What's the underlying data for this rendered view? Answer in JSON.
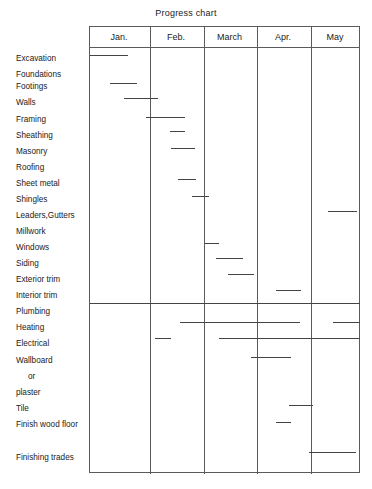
{
  "chart_data": {
    "type": "bar",
    "orientation": "horizontal",
    "subtype": "gantt",
    "title": "Progress chart",
    "xlabel": "",
    "ylabel": "",
    "grid": true,
    "legend": "none",
    "axis_unit": "month",
    "x_categories": [
      "Jan.",
      "Feb.",
      "March",
      "Apr.",
      "May"
    ],
    "x_axis_ranges": [
      {
        "label": "Jan.",
        "left_px": 89,
        "right_px": 149
      },
      {
        "label": "Feb.",
        "left_px": 149,
        "right_px": 203
      },
      {
        "label": "March",
        "left_px": 203,
        "right_px": 256
      },
      {
        "label": "Apr.",
        "left_px": 256,
        "right_px": 310
      },
      {
        "label": "May",
        "left_px": 310,
        "right_px": 360
      }
    ],
    "categories": [
      "Excavation",
      "Foundations",
      "Footings",
      "Walls",
      "Framing",
      "Sheathing",
      "Masonry",
      "Roofing",
      "Sheet metal",
      "Shingles",
      "Leaders,Gutters",
      "Millwork",
      "Windows",
      "Siding",
      "Exterior trim",
      "Interior trim",
      "Plumbing",
      "Heating",
      "Electrical",
      "Wallboard",
      "or",
      "plaster",
      "Tile",
      "Finish wood floor",
      "Finishing trades"
    ],
    "tasks": [
      {
        "name": "Excavation",
        "label_y": 58,
        "bar_y": 55,
        "start_px": 90,
        "end_px": 128,
        "start_month": 0.02,
        "end_month": 0.65
      },
      {
        "name": "Foundations",
        "label_y": 74,
        "bar_y": null,
        "start_px": null,
        "end_px": null,
        "start_month": null,
        "end_month": null
      },
      {
        "name": "Footings",
        "label_y": 86,
        "bar_y": 83,
        "start_px": 110,
        "end_px": 137,
        "start_month": 0.35,
        "end_month": 0.8
      },
      {
        "name": "Walls",
        "label_y": 102,
        "bar_y": 98,
        "start_px": 124,
        "end_px": 158,
        "start_month": 0.58,
        "end_month": 1.15
      },
      {
        "name": "Framing",
        "label_y": 119,
        "bar_y": 117,
        "start_px": 146,
        "end_px": 185,
        "start_month": 0.95,
        "end_month": 1.67
      },
      {
        "name": "Sheathing",
        "label_y": 135,
        "bar_y": 131,
        "start_px": 170,
        "end_px": 185,
        "start_month": 1.39,
        "end_month": 1.67
      },
      {
        "name": "Masonry",
        "label_y": 151,
        "bar_y": 148,
        "start_px": 171,
        "end_px": 195,
        "start_month": 1.41,
        "end_month": 1.85
      },
      {
        "name": "Roofing",
        "label_y": 167,
        "bar_y": null,
        "start_px": null,
        "end_px": null,
        "start_month": null,
        "end_month": null
      },
      {
        "name": "Sheet metal",
        "label_y": 183,
        "bar_y": 179,
        "start_px": 178,
        "end_px": 196,
        "start_month": 1.54,
        "end_month": 1.87
      },
      {
        "name": "Shingles",
        "label_y": 199,
        "bar_y": 196,
        "start_px": 192,
        "end_px": 209,
        "start_month": 1.8,
        "end_month": 2.11
      },
      {
        "name": "Leaders,Gutters",
        "label_y": 215,
        "bar_y": 211,
        "start_px": 328,
        "end_px": 357,
        "start_month": 4.36,
        "end_month": 4.94
      },
      {
        "name": "Millwork",
        "label_y": 231,
        "bar_y": null,
        "start_px": null,
        "end_px": null,
        "start_month": null,
        "end_month": null
      },
      {
        "name": "Windows",
        "label_y": 247,
        "bar_y": 243,
        "start_px": 205,
        "end_px": 219,
        "start_month": 2.04,
        "end_month": 2.3
      },
      {
        "name": "Siding",
        "label_y": 263,
        "bar_y": 258,
        "start_px": 216,
        "end_px": 243,
        "start_month": 2.24,
        "end_month": 2.75
      },
      {
        "name": "Exterior trim",
        "label_y": 279,
        "bar_y": 274,
        "start_px": 228,
        "end_px": 254,
        "start_month": 2.47,
        "end_month": 2.96
      },
      {
        "name": "Interior trim",
        "label_y": 295,
        "bar_y": 290,
        "start_px": 276,
        "end_px": 301,
        "start_month": 3.37,
        "end_month": 3.83
      },
      {
        "name": "Plumbing",
        "label_y": 311,
        "bar_y": 303,
        "start_px": 90,
        "end_px": 360,
        "start_month": 0.02,
        "end_month": 5.0
      },
      {
        "name": "Heating",
        "label_y": 327,
        "bar_y": 322,
        "start_px": 180,
        "end_px": 300,
        "start_month": 1.58,
        "end_month": 3.81
      },
      {
        "name": "Heating-2",
        "label_y": null,
        "bar_y": 322,
        "start_px": 333,
        "end_px": 360,
        "start_month": 4.46,
        "end_month": 5.0
      },
      {
        "name": "Electrical",
        "label_y": 343,
        "bar_y": 338,
        "start_px": 155,
        "end_px": 171,
        "start_month": 1.11,
        "end_month": 1.41
      },
      {
        "name": "Electrical-2",
        "label_y": null,
        "bar_y": 338,
        "start_px": 219,
        "end_px": 360,
        "start_month": 2.3,
        "end_month": 5.0
      },
      {
        "name": "Wallboard",
        "label_y": 360,
        "bar_y": 357,
        "start_px": 251,
        "end_px": 291,
        "start_month": 2.9,
        "end_month": 3.64
      },
      {
        "name": "or",
        "label_y": 376,
        "bar_y": null,
        "start_px": null,
        "end_px": null,
        "start_month": null,
        "end_month": null
      },
      {
        "name": "plaster",
        "label_y": 392,
        "bar_y": null,
        "start_px": null,
        "end_px": null,
        "start_month": null,
        "end_month": null
      },
      {
        "name": "Tile",
        "label_y": 408,
        "bar_y": 405,
        "start_px": 289,
        "end_px": 313,
        "start_month": 3.61,
        "end_month": 4.05
      },
      {
        "name": "Finish wood floor",
        "label_y": 424,
        "bar_y": 422,
        "start_px": 276,
        "end_px": 291,
        "start_month": 3.37,
        "end_month": 3.64
      },
      {
        "name": "Finishing trades",
        "label_y": 457,
        "bar_y": 452,
        "start_px": 309,
        "end_px": 356,
        "start_month": 4.0,
        "end_month": 4.92
      }
    ]
  },
  "title": {
    "text": "Progress chart"
  },
  "months": [
    {
      "label": "Jan.",
      "left": 89,
      "width": 60
    },
    {
      "label": "Feb.",
      "left": 149,
      "width": 54
    },
    {
      "label": "March",
      "left": 203,
      "width": 53
    },
    {
      "label": "Apr.",
      "left": 256,
      "width": 54
    },
    {
      "label": "May",
      "left": 310,
      "width": 50
    }
  ],
  "rows": [
    {
      "label": "Excavation",
      "top": 54,
      "indent": false
    },
    {
      "label": "Foundations",
      "top": 70,
      "indent": false
    },
    {
      "label": "Footings",
      "top": 82,
      "indent": false
    },
    {
      "label": "Walls",
      "top": 98,
      "indent": false
    },
    {
      "label": "Framing",
      "top": 115,
      "indent": false
    },
    {
      "label": "Sheathing",
      "top": 131,
      "indent": false
    },
    {
      "label": "Masonry",
      "top": 147,
      "indent": false
    },
    {
      "label": "Roofing",
      "top": 163,
      "indent": false
    },
    {
      "label": "Sheet metal",
      "top": 179,
      "indent": false
    },
    {
      "label": "Shingles",
      "top": 195,
      "indent": false
    },
    {
      "label": "Leaders,Gutters",
      "top": 211,
      "indent": false
    },
    {
      "label": "Millwork",
      "top": 227,
      "indent": false
    },
    {
      "label": "Windows",
      "top": 243,
      "indent": false
    },
    {
      "label": "Siding",
      "top": 259,
      "indent": false
    },
    {
      "label": "Exterior trim",
      "top": 275,
      "indent": false
    },
    {
      "label": "Interior trim",
      "top": 291,
      "indent": false
    },
    {
      "label": "Plumbing",
      "top": 307,
      "indent": false
    },
    {
      "label": "Heating",
      "top": 323,
      "indent": false
    },
    {
      "label": "Electrical",
      "top": 339,
      "indent": false
    },
    {
      "label": "Wallboard",
      "top": 356,
      "indent": false
    },
    {
      "label": "or",
      "top": 372,
      "indent": true
    },
    {
      "label": "plaster",
      "top": 388,
      "indent": false
    },
    {
      "label": "Tile",
      "top": 404,
      "indent": false
    },
    {
      "label": "Finish wood floor",
      "top": 420,
      "indent": false
    },
    {
      "label": "Finishing trades",
      "top": 453,
      "indent": false
    }
  ],
  "bars": [
    {
      "name": "excavation",
      "left": 90,
      "width": 38,
      "top": 55
    },
    {
      "name": "footings",
      "left": 110,
      "width": 27,
      "top": 83
    },
    {
      "name": "walls",
      "left": 124,
      "width": 34,
      "top": 98
    },
    {
      "name": "framing",
      "left": 146,
      "width": 39,
      "top": 117
    },
    {
      "name": "sheathing",
      "left": 170,
      "width": 15,
      "top": 131
    },
    {
      "name": "masonry",
      "left": 171,
      "width": 24,
      "top": 148
    },
    {
      "name": "sheet-metal",
      "left": 178,
      "width": 18,
      "top": 179
    },
    {
      "name": "shingles",
      "left": 192,
      "width": 17,
      "top": 196
    },
    {
      "name": "leaders-gutters",
      "left": 328,
      "width": 29,
      "top": 211
    },
    {
      "name": "windows",
      "left": 205,
      "width": 14,
      "top": 243
    },
    {
      "name": "siding",
      "left": 216,
      "width": 27,
      "top": 258
    },
    {
      "name": "exterior-trim",
      "left": 228,
      "width": 26,
      "top": 274
    },
    {
      "name": "interior-trim",
      "left": 276,
      "width": 25,
      "top": 290
    },
    {
      "name": "plumbing",
      "left": 90,
      "width": 270,
      "top": 303
    },
    {
      "name": "heating-a",
      "left": 180,
      "width": 120,
      "top": 322
    },
    {
      "name": "heating-b",
      "left": 333,
      "width": 27,
      "top": 322
    },
    {
      "name": "electrical-a",
      "left": 155,
      "width": 16,
      "top": 338
    },
    {
      "name": "electrical-b",
      "left": 219,
      "width": 141,
      "top": 338
    },
    {
      "name": "wallboard",
      "left": 251,
      "width": 40,
      "top": 357
    },
    {
      "name": "tile",
      "left": 289,
      "width": 24,
      "top": 405
    },
    {
      "name": "finish-wood-floor",
      "left": 276,
      "width": 15,
      "top": 422
    },
    {
      "name": "finishing-trades",
      "left": 309,
      "width": 47,
      "top": 452
    }
  ],
  "dividers": [
    60,
    114,
    167,
    221
  ]
}
